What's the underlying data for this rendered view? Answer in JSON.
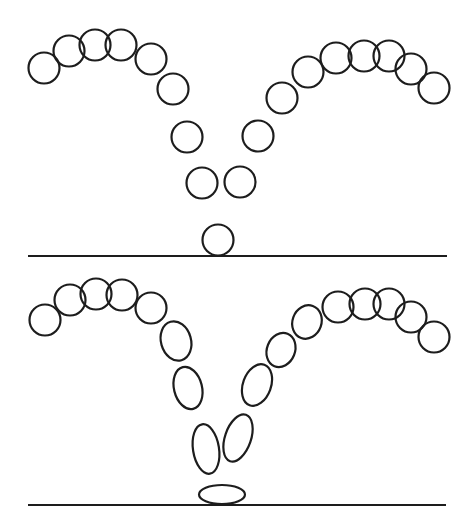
{
  "canvas": {
    "width": 471,
    "height": 523,
    "background_color": "#ffffff",
    "stroke_color": "#1d1d1d",
    "ball_stroke_width": 2.2,
    "ground_stroke_width": 1.8
  },
  "panels": [
    {
      "name": "bounce-path-uniform-circles",
      "ground_line": {
        "x1": 28,
        "y1": 256,
        "x2": 447,
        "y2": 256
      },
      "shapes": [
        {
          "form": "circle",
          "cx": 44,
          "cy": 68,
          "rx": 15.5,
          "ry": 15.5,
          "rot": 0
        },
        {
          "form": "circle",
          "cx": 69,
          "cy": 51,
          "rx": 15.5,
          "ry": 15.5,
          "rot": 0
        },
        {
          "form": "circle",
          "cx": 95,
          "cy": 45,
          "rx": 15.5,
          "ry": 15.5,
          "rot": 0
        },
        {
          "form": "circle",
          "cx": 121,
          "cy": 45,
          "rx": 15.5,
          "ry": 15.5,
          "rot": 0
        },
        {
          "form": "circle",
          "cx": 151,
          "cy": 59,
          "rx": 15.5,
          "ry": 15.5,
          "rot": 0
        },
        {
          "form": "circle",
          "cx": 173,
          "cy": 89,
          "rx": 15.5,
          "ry": 15.5,
          "rot": 0
        },
        {
          "form": "circle",
          "cx": 187,
          "cy": 137,
          "rx": 15.5,
          "ry": 15.5,
          "rot": 0
        },
        {
          "form": "circle",
          "cx": 202,
          "cy": 183,
          "rx": 15.5,
          "ry": 15.5,
          "rot": 0
        },
        {
          "form": "circle",
          "cx": 218,
          "cy": 240,
          "rx": 15.5,
          "ry": 15.5,
          "rot": 0
        },
        {
          "form": "circle",
          "cx": 240,
          "cy": 182,
          "rx": 15.5,
          "ry": 15.5,
          "rot": 0
        },
        {
          "form": "circle",
          "cx": 258,
          "cy": 136,
          "rx": 15.5,
          "ry": 15.5,
          "rot": 0
        },
        {
          "form": "circle",
          "cx": 282,
          "cy": 98,
          "rx": 15.5,
          "ry": 15.5,
          "rot": 0
        },
        {
          "form": "circle",
          "cx": 308,
          "cy": 72,
          "rx": 15.5,
          "ry": 15.5,
          "rot": 0
        },
        {
          "form": "circle",
          "cx": 336,
          "cy": 58,
          "rx": 15.5,
          "ry": 15.5,
          "rot": 0
        },
        {
          "form": "circle",
          "cx": 364,
          "cy": 56,
          "rx": 15.5,
          "ry": 15.5,
          "rot": 0
        },
        {
          "form": "circle",
          "cx": 389,
          "cy": 56,
          "rx": 15.5,
          "ry": 15.5,
          "rot": 0
        },
        {
          "form": "circle",
          "cx": 411,
          "cy": 69,
          "rx": 15.5,
          "ry": 15.5,
          "rot": 0
        },
        {
          "form": "circle",
          "cx": 434,
          "cy": 88,
          "rx": 15.5,
          "ry": 15.5,
          "rot": 0
        }
      ]
    },
    {
      "name": "bounce-path-squash-and-stretch",
      "ground_line": {
        "x1": 28,
        "y1": 505,
        "x2": 446,
        "y2": 505
      },
      "shapes": [
        {
          "form": "circle",
          "cx": 45,
          "cy": 320,
          "rx": 15.5,
          "ry": 15.5,
          "rot": 0
        },
        {
          "form": "circle",
          "cx": 70,
          "cy": 300,
          "rx": 15.5,
          "ry": 15.5,
          "rot": 0
        },
        {
          "form": "circle",
          "cx": 96,
          "cy": 294,
          "rx": 15.5,
          "ry": 15.5,
          "rot": 0
        },
        {
          "form": "circle",
          "cx": 122,
          "cy": 295,
          "rx": 15.5,
          "ry": 15.5,
          "rot": 0
        },
        {
          "form": "circle",
          "cx": 151,
          "cy": 308,
          "rx": 15.5,
          "ry": 15.5,
          "rot": 0
        },
        {
          "form": "stretched",
          "cx": 176,
          "cy": 341,
          "rx": 15,
          "ry": 20,
          "rot": -16
        },
        {
          "form": "stretched",
          "cx": 188,
          "cy": 388,
          "rx": 14,
          "ry": 21.5,
          "rot": -14
        },
        {
          "form": "stretched",
          "cx": 206,
          "cy": 449,
          "rx": 13,
          "ry": 25,
          "rot": -9
        },
        {
          "form": "squashed",
          "cx": 222,
          "cy": 494.5,
          "rx": 23,
          "ry": 9.5,
          "rot": 0
        },
        {
          "form": "stretched",
          "cx": 238,
          "cy": 438,
          "rx": 13,
          "ry": 24.5,
          "rot": 19
        },
        {
          "form": "stretched",
          "cx": 257,
          "cy": 385,
          "rx": 14,
          "ry": 21.5,
          "rot": 20
        },
        {
          "form": "stretched",
          "cx": 281,
          "cy": 350,
          "rx": 14,
          "ry": 17.5,
          "rot": 22
        },
        {
          "form": "stretched",
          "cx": 307,
          "cy": 322,
          "rx": 14.5,
          "ry": 17,
          "rot": 20
        },
        {
          "form": "circle",
          "cx": 338,
          "cy": 307,
          "rx": 15.5,
          "ry": 15.5,
          "rot": 0
        },
        {
          "form": "circle",
          "cx": 365,
          "cy": 304,
          "rx": 15.5,
          "ry": 15.5,
          "rot": 0
        },
        {
          "form": "circle",
          "cx": 389,
          "cy": 304,
          "rx": 15.5,
          "ry": 15.5,
          "rot": 0
        },
        {
          "form": "circle",
          "cx": 411,
          "cy": 317,
          "rx": 15.5,
          "ry": 15.5,
          "rot": 0
        },
        {
          "form": "circle",
          "cx": 434,
          "cy": 337,
          "rx": 15.5,
          "ry": 15.5,
          "rot": 0
        }
      ]
    }
  ]
}
